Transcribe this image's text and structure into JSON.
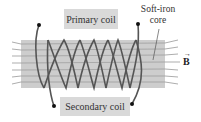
{
  "diagram": {
    "labels": {
      "primary_coil": "Primary coil",
      "secondary_coil": "Secondary coil",
      "core_line1": "Soft-iron",
      "core_line2": "core",
      "field_symbol": "B",
      "field_arrow": "→"
    },
    "colors": {
      "core": "#c4c4c4",
      "coil_wire": "#555555",
      "field_lines": "#8a8a8a",
      "label_bg": "#d9d9d9",
      "terminal": "#111111"
    }
  }
}
